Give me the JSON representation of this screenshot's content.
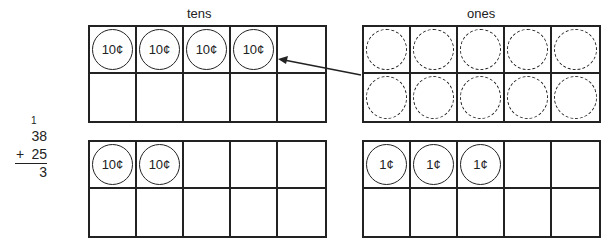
{
  "labels": {
    "tens": "tens",
    "ones": "ones"
  },
  "calculation": {
    "carry": "1",
    "addend1": "38",
    "operator": "+",
    "addend2": "25",
    "result_partial": "3"
  },
  "grids": {
    "tens_top": {
      "cells": [
        "10¢",
        "10¢",
        "10¢",
        "10¢",
        "",
        "",
        "",
        "",
        "",
        ""
      ],
      "dashed": false
    },
    "ones_top": {
      "cells": [
        "",
        "",
        "",
        "",
        "",
        "",
        "",
        "",
        "",
        ""
      ],
      "dashed_circles": 10
    },
    "tens_bottom": {
      "cells": [
        "10¢",
        "10¢",
        "",
        "",
        "",
        "",
        "",
        "",
        "",
        ""
      ]
    },
    "ones_bottom": {
      "cells": [
        "1¢",
        "1¢",
        "1¢",
        "",
        "",
        "",
        "",
        "",
        "",
        ""
      ]
    }
  },
  "arrow": {
    "from": "ones",
    "to": "tens",
    "description": "regroup 10 ones into 1 ten"
  }
}
